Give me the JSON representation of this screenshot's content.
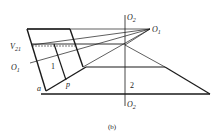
{
  "figure": {
    "caption": "(b)",
    "labels": {
      "o2_top": "O",
      "o2_top_sub": "2",
      "o2_bottom": "O",
      "o2_bottom_sub": "2",
      "o1_right": "O",
      "o1_right_sub": "1",
      "o1_left": "O",
      "o1_left_sub": "1",
      "v21": "V",
      "v21_sub": "21",
      "region_1": "1",
      "region_2": "2",
      "point_a": "a",
      "point_p": "p"
    },
    "colors": {
      "stroke": "#1a1a1a",
      "background": "#ffffff"
    }
  }
}
